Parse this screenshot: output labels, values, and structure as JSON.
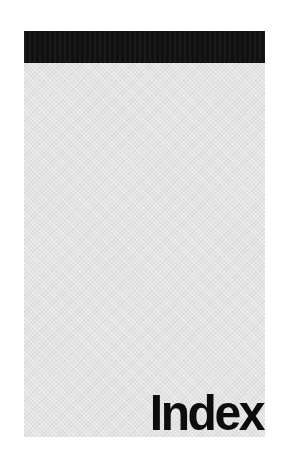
{
  "page": {
    "title": "Index",
    "colors": {
      "header_bar": "#111111",
      "panel": "#e4e4e4",
      "title_text": "#0d0d0d",
      "background": "#ffffff"
    }
  }
}
